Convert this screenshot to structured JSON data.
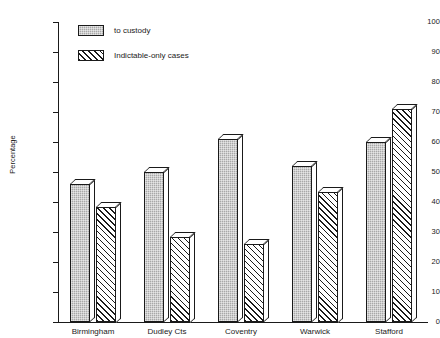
{
  "chart_data": {
    "type": "bar",
    "title": "",
    "xlabel": "",
    "ylabel": "Percentage",
    "ylim": [
      0,
      100
    ],
    "ytick_step": 10,
    "yticks": [
      "0",
      "10",
      "20",
      "30",
      "40",
      "50",
      "60",
      "70",
      "80",
      "90",
      "100"
    ],
    "grid": false,
    "legend_position": "top-left",
    "categories": [
      "Birmingham",
      "Dudley Cts",
      "Coventry",
      "Warwick",
      "Stafford"
    ],
    "series": [
      {
        "name": "to custody",
        "fill": "solid-grey",
        "color": "#a8a8a8",
        "values": [
          46,
          50,
          61,
          52,
          60
        ]
      },
      {
        "name": "Indictable-only cases",
        "fill": "diagonal-hatch",
        "color": "#ffffff",
        "values": [
          38.5,
          28.5,
          26,
          43.5,
          71
        ]
      }
    ]
  },
  "axis": {
    "y_title": "Percentage"
  },
  "legend": {
    "items": [
      {
        "label": "to custody"
      },
      {
        "label": "Indictable-only cases"
      }
    ]
  }
}
